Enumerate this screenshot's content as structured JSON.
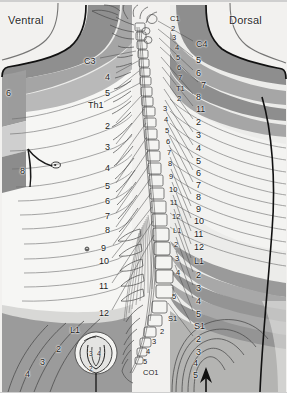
{
  "figure": {
    "title_left": "Ventral",
    "title_right": "Dorsal",
    "background": "#f2f1ef",
    "band_dark": "#9a9a9a",
    "band_light": "#e8e8e6",
    "outline": "#1a1a1a"
  },
  "ventral": {
    "labels": [
      {
        "text": "C3",
        "x": 84,
        "y": 56,
        "size": "big"
      },
      {
        "text": "4",
        "x": 105,
        "y": 72,
        "size": "big"
      },
      {
        "text": "5",
        "x": 105,
        "y": 88,
        "size": "big"
      },
      {
        "text": "6",
        "x": 6,
        "y": 88,
        "size": "big"
      },
      {
        "text": "Th1",
        "x": 88,
        "y": 100,
        "size": "big"
      },
      {
        "text": "2",
        "x": 105,
        "y": 121,
        "size": "big"
      },
      {
        "text": "3",
        "x": 105,
        "y": 142,
        "size": "big"
      },
      {
        "text": "4",
        "x": 105,
        "y": 163,
        "size": "big"
      },
      {
        "text": "8",
        "x": 20,
        "y": 166,
        "size": "big"
      },
      {
        "text": "5",
        "x": 105,
        "y": 181,
        "size": "big"
      },
      {
        "text": "6",
        "x": 105,
        "y": 196,
        "size": "big"
      },
      {
        "text": "7",
        "x": 105,
        "y": 211,
        "size": "big"
      },
      {
        "text": "8",
        "x": 105,
        "y": 225,
        "size": "big"
      },
      {
        "text": "9",
        "x": 101,
        "y": 243,
        "size": "big"
      },
      {
        "text": "10",
        "x": 99,
        "y": 256,
        "size": "big"
      },
      {
        "text": "11",
        "x": 99,
        "y": 281,
        "size": "big"
      },
      {
        "text": "12",
        "x": 99,
        "y": 308,
        "size": "big"
      },
      {
        "text": "L1",
        "x": 70,
        "y": 325,
        "size": "big"
      },
      {
        "text": "2",
        "x": 56,
        "y": 344,
        "size": "big"
      },
      {
        "text": "3",
        "x": 40,
        "y": 357,
        "size": "big"
      },
      {
        "text": "4",
        "x": 25,
        "y": 369,
        "size": "big"
      }
    ],
    "perineal_inset": [
      {
        "text": "3",
        "x": 89,
        "y": 350
      },
      {
        "text": "4",
        "x": 97,
        "y": 350
      },
      {
        "text": "2",
        "x": 89,
        "y": 365
      }
    ]
  },
  "dorsal": {
    "labels": [
      {
        "text": "C4",
        "x": 196,
        "y": 39,
        "size": "big"
      },
      {
        "text": "5",
        "x": 196,
        "y": 55,
        "size": "big"
      },
      {
        "text": "6",
        "x": 196,
        "y": 68,
        "size": "big"
      },
      {
        "text": "7",
        "x": 201,
        "y": 80,
        "size": "big"
      },
      {
        "text": "8",
        "x": 196,
        "y": 92,
        "size": "big"
      },
      {
        "text": "11",
        "x": 196,
        "y": 104,
        "size": "big"
      },
      {
        "text": "2",
        "x": 196,
        "y": 117,
        "size": "big"
      },
      {
        "text": "3",
        "x": 196,
        "y": 130,
        "size": "big"
      },
      {
        "text": "4",
        "x": 196,
        "y": 143,
        "size": "big"
      },
      {
        "text": "5",
        "x": 196,
        "y": 156,
        "size": "big"
      },
      {
        "text": "6",
        "x": 196,
        "y": 168,
        "size": "big"
      },
      {
        "text": "7",
        "x": 196,
        "y": 180,
        "size": "big"
      },
      {
        "text": "8",
        "x": 196,
        "y": 192,
        "size": "big"
      },
      {
        "text": "9",
        "x": 196,
        "y": 204,
        "size": "big"
      },
      {
        "text": "10",
        "x": 194,
        "y": 216,
        "size": "big"
      },
      {
        "text": "11",
        "x": 194,
        "y": 229,
        "size": "big"
      },
      {
        "text": "12",
        "x": 194,
        "y": 242,
        "size": "big"
      },
      {
        "text": "L1",
        "x": 194,
        "y": 256,
        "size": "big"
      },
      {
        "text": "2",
        "x": 196,
        "y": 270,
        "size": "big"
      },
      {
        "text": "3",
        "x": 196,
        "y": 283,
        "size": "big"
      },
      {
        "text": "4",
        "x": 196,
        "y": 296,
        "size": "big"
      },
      {
        "text": "5",
        "x": 196,
        "y": 309,
        "size": "big"
      },
      {
        "text": "S1",
        "x": 194,
        "y": 321,
        "size": "big"
      },
      {
        "text": "2",
        "x": 196,
        "y": 334,
        "size": "big"
      },
      {
        "text": "3",
        "x": 196,
        "y": 347,
        "size": "big"
      },
      {
        "text": "4",
        "x": 193,
        "y": 358,
        "size": "big"
      },
      {
        "text": "5",
        "x": 193,
        "y": 370,
        "size": "big"
      }
    ]
  },
  "spine": {
    "labels": [
      {
        "text": "C1",
        "x": 170,
        "y": 14
      },
      {
        "text": "2",
        "x": 171,
        "y": 24
      },
      {
        "text": "3",
        "x": 172,
        "y": 33
      },
      {
        "text": "4",
        "x": 175,
        "y": 43
      },
      {
        "text": "5",
        "x": 176,
        "y": 53
      },
      {
        "text": "6",
        "x": 177,
        "y": 63
      },
      {
        "text": "7",
        "x": 178,
        "y": 73
      },
      {
        "text": "T1",
        "x": 176,
        "y": 84
      },
      {
        "text": "2",
        "x": 177,
        "y": 94
      },
      {
        "text": "3",
        "x": 163,
        "y": 104
      },
      {
        "text": "4",
        "x": 164,
        "y": 115
      },
      {
        "text": "5",
        "x": 165,
        "y": 126
      },
      {
        "text": "6",
        "x": 166,
        "y": 137
      },
      {
        "text": "7",
        "x": 167,
        "y": 148
      },
      {
        "text": "8",
        "x": 168,
        "y": 159
      },
      {
        "text": "9",
        "x": 169,
        "y": 172
      },
      {
        "text": "10",
        "x": 169,
        "y": 185
      },
      {
        "text": "11",
        "x": 170,
        "y": 198
      },
      {
        "text": "12",
        "x": 172,
        "y": 212
      },
      {
        "text": "L1",
        "x": 173,
        "y": 226
      },
      {
        "text": "2",
        "x": 174,
        "y": 240
      },
      {
        "text": "3",
        "x": 175,
        "y": 254
      },
      {
        "text": "4",
        "x": 176,
        "y": 268
      },
      {
        "text": "5",
        "x": 172,
        "y": 292
      },
      {
        "text": "S1",
        "x": 168,
        "y": 314
      },
      {
        "text": "2",
        "x": 160,
        "y": 327
      },
      {
        "text": "3",
        "x": 152,
        "y": 337
      },
      {
        "text": "4",
        "x": 146,
        "y": 347
      },
      {
        "text": "5",
        "x": 143,
        "y": 357
      },
      {
        "text": "CO1",
        "x": 143,
        "y": 368
      }
    ]
  }
}
